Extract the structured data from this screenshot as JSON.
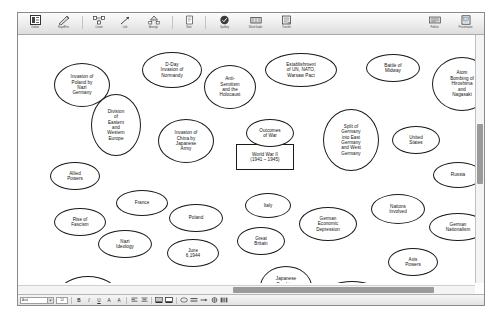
{
  "app": {
    "toolbar": {
      "items": [
        {
          "label": "Outline",
          "icon": "outline-icon"
        },
        {
          "label": "RapidFire",
          "icon": "lightning-pencil-icon"
        },
        {
          "label": "Create",
          "icon": "grid-create-icon"
        },
        {
          "label": "Link",
          "icon": "link-arrow-icon"
        },
        {
          "label": "Arrange",
          "icon": "arrange-hierarchy-icon"
        },
        {
          "label": "Note",
          "icon": "note-icon"
        },
        {
          "label": "Spelling",
          "icon": "spelling-check-icon"
        },
        {
          "label": "Word Guide",
          "icon": "word-guide-icon"
        },
        {
          "label": "Transfer",
          "icon": "transfer-icon"
        }
      ],
      "right_items": [
        {
          "label": "Publish",
          "icon": "publish-icon"
        },
        {
          "label": "Presentation",
          "icon": "presentation-icon"
        }
      ]
    },
    "format_bar": {
      "font": "Arial",
      "font_size": "14",
      "buttons": [
        {
          "label": "B",
          "icon": "bold-icon"
        },
        {
          "label": "I",
          "icon": "italic-icon"
        },
        {
          "label": "U",
          "icon": "underline-icon"
        },
        {
          "label": "A",
          "icon": "text-color-icon"
        },
        {
          "label": "A",
          "icon": "text-size-icon"
        },
        {
          "label": "",
          "icon": "align-left-icon"
        },
        {
          "label": "",
          "icon": "align-center-icon"
        },
        {
          "label": "",
          "icon": "fill-color-icon"
        },
        {
          "label": "",
          "icon": "line-color-icon"
        },
        {
          "label": "",
          "icon": "shape-icon"
        },
        {
          "label": "",
          "icon": "line-style-icon"
        },
        {
          "label": "",
          "icon": "arrow-style-icon"
        },
        {
          "label": "",
          "icon": "position-icon"
        },
        {
          "label": "",
          "icon": "multimedia-icon"
        }
      ]
    },
    "scrollbars": {
      "vertical_visible": true,
      "horizontal_visible": true
    }
  },
  "diagram": {
    "central_topic": {
      "name": "central-topic",
      "text": "World War II\n(1941 – 1945)",
      "shape": "rect",
      "x": 218,
      "y": 109,
      "w": 58,
      "h": 26
    },
    "nodes": [
      {
        "name": "node-invasion-poland",
        "text": "Invasion of\nPoland by\nNazi\nGermany",
        "shape": "oval",
        "x": 36,
        "y": 28,
        "w": 56,
        "h": 44
      },
      {
        "name": "node-dday",
        "text": "D-Day\nInvasion of\nNormandy",
        "shape": "oval",
        "x": 124,
        "y": 17,
        "w": 60,
        "h": 36
      },
      {
        "name": "node-anti-semitism",
        "text": "Anti-\nSemitism\nand the\nHolocaust",
        "shape": "oval",
        "x": 186,
        "y": 30,
        "w": 52,
        "h": 44
      },
      {
        "name": "node-establishment",
        "text": "Establishment\nof UN, NATO,\nWarsaw Pact",
        "shape": "oval",
        "x": 247,
        "y": 18,
        "w": 72,
        "h": 34
      },
      {
        "name": "node-battle-midway",
        "text": "Battle of\nMidway",
        "shape": "oval",
        "x": 348,
        "y": 19,
        "w": 54,
        "h": 28
      },
      {
        "name": "node-atom-bombing",
        "text": "Atom\nBombing of\nHiroshima\nand\nNagasaki",
        "shape": "oval",
        "x": 414,
        "y": 22,
        "w": 60,
        "h": 54
      },
      {
        "name": "node-division-europe",
        "text": "Division\nof\nEastern\nand\nWestern\nEurope",
        "shape": "oval",
        "x": 73,
        "y": 59,
        "w": 50,
        "h": 62
      },
      {
        "name": "node-outcomes-war",
        "text": "Outcomes\nof War",
        "shape": "oval",
        "x": 228,
        "y": 84,
        "w": 48,
        "h": 28
      },
      {
        "name": "node-split-germany",
        "text": "Split of\nGermany\ninto East\nGermany\nand West\nGermany",
        "shape": "oval",
        "x": 305,
        "y": 74,
        "w": 56,
        "h": 62
      },
      {
        "name": "node-invasion-china",
        "text": "Invasion of\nChina by\nJapanese\nArmy",
        "shape": "oval",
        "x": 140,
        "y": 84,
        "w": 56,
        "h": 44
      },
      {
        "name": "node-united-states",
        "text": "United\nStates",
        "shape": "oval",
        "x": 374,
        "y": 91,
        "w": 48,
        "h": 28
      },
      {
        "name": "node-russia",
        "text": "Russia",
        "shape": "oval",
        "x": 415,
        "y": 127,
        "w": 50,
        "h": 26
      },
      {
        "name": "node-allied-powers",
        "text": "Allied\nPowers",
        "shape": "oval",
        "x": 32,
        "y": 127,
        "w": 50,
        "h": 28
      },
      {
        "name": "node-france",
        "text": "France",
        "shape": "oval",
        "x": 98,
        "y": 155,
        "w": 52,
        "h": 26
      },
      {
        "name": "node-italy",
        "text": "Italy",
        "shape": "oval",
        "x": 227,
        "y": 158,
        "w": 46,
        "h": 25
      },
      {
        "name": "node-rise-fascism",
        "text": "Rise of\nFascism",
        "shape": "oval",
        "x": 36,
        "y": 173,
        "w": 52,
        "h": 28
      },
      {
        "name": "node-poland",
        "text": "Poland",
        "shape": "oval",
        "x": 151,
        "y": 169,
        "w": 54,
        "h": 28
      },
      {
        "name": "node-german-depression",
        "text": "German\nEconomic\nDepression",
        "shape": "oval",
        "x": 281,
        "y": 172,
        "w": 58,
        "h": 34
      },
      {
        "name": "node-nations-involved",
        "text": "Nations\nInvolved",
        "shape": "oval",
        "x": 353,
        "y": 159,
        "w": 54,
        "h": 30
      },
      {
        "name": "node-german-nationalism",
        "text": "German\nNationalism",
        "shape": "oval",
        "x": 411,
        "y": 178,
        "w": 58,
        "h": 28
      },
      {
        "name": "node-nazi-ideology",
        "text": "Nazi\nIdeology",
        "shape": "oval",
        "x": 80,
        "y": 195,
        "w": 54,
        "h": 28
      },
      {
        "name": "node-june-1944",
        "text": "June\n6,1944",
        "shape": "oval",
        "x": 149,
        "y": 204,
        "w": 52,
        "h": 28
      },
      {
        "name": "node-great-britain",
        "text": "Great\nBritain",
        "shape": "oval",
        "x": 219,
        "y": 192,
        "w": 48,
        "h": 28
      },
      {
        "name": "node-axis-powers",
        "text": "Axis\nPowers",
        "shape": "oval",
        "x": 370,
        "y": 213,
        "w": 50,
        "h": 28
      },
      {
        "name": "node-factors-war",
        "text": "Factors\nLeading to\nWar",
        "shape": "oval",
        "x": 42,
        "y": 241,
        "w": 56,
        "h": 32
      },
      {
        "name": "node-germany",
        "text": "Germany",
        "shape": "oval",
        "x": 140,
        "y": 249,
        "w": 56,
        "h": 28
      },
      {
        "name": "node-japanese-bombing",
        "text": "Japanese\nBombing\nof Pearl\nHarbor",
        "shape": "oval",
        "x": 242,
        "y": 231,
        "w": 52,
        "h": 42
      },
      {
        "name": "node-key-battles",
        "text": "Key Battles",
        "shape": "oval",
        "x": 306,
        "y": 246,
        "w": 56,
        "h": 26
      },
      {
        "name": "node-japan",
        "text": "Japan",
        "shape": "oval",
        "x": 403,
        "y": 248,
        "w": 52,
        "h": 26
      }
    ]
  }
}
